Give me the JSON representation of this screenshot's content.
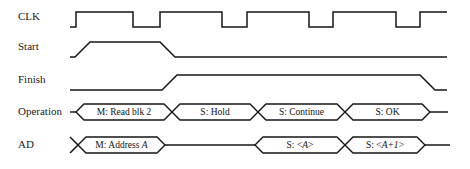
{
  "figure": {
    "type": "timing-diagram",
    "width": 470,
    "height": 169,
    "background_color": "#ffffff",
    "line_color": "#161616"
  },
  "rows": [
    {
      "id": "clk",
      "label": "CLK",
      "label_x": 18,
      "label_y": 17,
      "baseline_y": 27,
      "high_y": 12
    },
    {
      "id": "start",
      "label": "Start",
      "label_x": 18,
      "label_y": 47,
      "baseline_y": 57,
      "high_y": 42
    },
    {
      "id": "finish",
      "label": "Finish",
      "label_x": 18,
      "label_y": 80,
      "baseline_y": 90,
      "high_y": 75
    },
    {
      "id": "operation",
      "label": "Operation",
      "label_x": 18,
      "label_y": 112,
      "baseline_y": 112,
      "high_y": 112
    },
    {
      "id": "ad",
      "label": "AD",
      "label_x": 18,
      "label_y": 145,
      "baseline_y": 145,
      "high_y": 145
    }
  ],
  "clk": {
    "name": "CLK",
    "start_x": 70,
    "end_x": 447,
    "initial_level": "low",
    "edges": [
      {
        "x": 76,
        "to": "high"
      },
      {
        "x": 133,
        "to": "low"
      },
      {
        "x": 160,
        "to": "high"
      },
      {
        "x": 222,
        "to": "low"
      },
      {
        "x": 247,
        "to": "high"
      },
      {
        "x": 309,
        "to": "low"
      },
      {
        "x": 333,
        "to": "high"
      },
      {
        "x": 396,
        "to": "low"
      },
      {
        "x": 420,
        "to": "high"
      }
    ]
  },
  "start": {
    "name": "Start",
    "start_x": 70,
    "end_x": 447,
    "initial_level": "low",
    "slope": 15,
    "transitions": [
      {
        "x": 75,
        "to": "high"
      },
      {
        "x": 160,
        "to": "low"
      }
    ]
  },
  "finish": {
    "name": "Finish",
    "start_x": 70,
    "end_x": 447,
    "initial_level": "low",
    "slope": 15,
    "transitions": [
      {
        "x": 162,
        "to": "high"
      },
      {
        "x": 420,
        "to": "low"
      }
    ]
  },
  "operation": {
    "name": "Operation",
    "start_x": 70,
    "end_x": 448,
    "lead_line_end": 76,
    "bus_half_height": 8,
    "bevel": 8,
    "segments": [
      {
        "x1": 76,
        "x2": 172,
        "label": "M: Read blk 2",
        "italic_suffix": ""
      },
      {
        "x1": 172,
        "x2": 258,
        "label": "S: Hold",
        "italic_suffix": ""
      },
      {
        "x1": 258,
        "x2": 345,
        "label": "S: Continue",
        "italic_suffix": ""
      },
      {
        "x1": 345,
        "x2": 430,
        "label": "S: OK",
        "italic_suffix": ""
      }
    ]
  },
  "ad": {
    "name": "AD",
    "start_x": 70,
    "end_x": 450,
    "bus_half_height": 8,
    "bevel": 8,
    "segments": [
      {
        "x1": 78,
        "x2": 165,
        "label_pre": "M: Address ",
        "label_ital": "A",
        "label_post": ""
      },
      {
        "x1": 255,
        "x2": 345,
        "label_pre": "S: <",
        "label_ital": "A",
        "label_post": ">"
      },
      {
        "x1": 345,
        "x2": 425,
        "label_pre": "S: <",
        "label_ital": "A+1",
        "label_post": ">"
      }
    ],
    "idle_spans": [
      {
        "x1": 165,
        "x2": 255
      },
      {
        "x1": 425,
        "x2": 450
      }
    ],
    "lead_cross_x": 78
  }
}
